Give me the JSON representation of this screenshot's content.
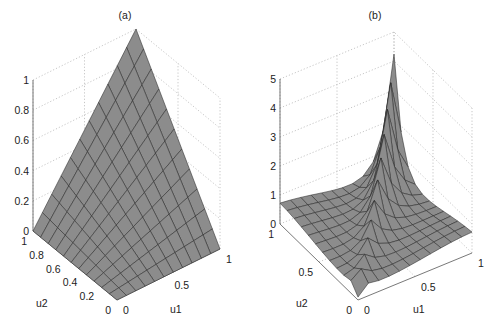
{
  "figure": {
    "background": "#ffffff",
    "surface_color": "#8c8c8c",
    "edge_color": "#2a2a2a",
    "grid_color": "#b8b8b8"
  },
  "chart_data": [
    {
      "type": "surface",
      "title": "(a)",
      "xlabel": "u1",
      "ylabel": "u2",
      "zlabel": "",
      "xlim": [
        0,
        1
      ],
      "ylim": [
        0,
        1
      ],
      "zlim": [
        0,
        1
      ],
      "xticks": [
        "0",
        "0.5",
        "1"
      ],
      "yticks": [
        "0",
        "0.2",
        "0.4",
        "0.6",
        "0.8",
        "1"
      ],
      "zticks": [
        "0",
        "0.2",
        "0.4",
        "0.6",
        "0.8",
        "1"
      ],
      "grid": true,
      "mesh": 11,
      "description": "z = u1*u2 (bilinear surface rising from 0 along edges u1=0 and u2=0 to 1 at corner (1,1))",
      "surface_formula": "u1*u2"
    },
    {
      "type": "surface",
      "title": "(b)",
      "xlabel": "u1",
      "ylabel": "u2",
      "zlabel": "",
      "xlim": [
        0,
        1
      ],
      "ylim": [
        0,
        1
      ],
      "zlim": [
        0,
        5
      ],
      "xticks": [
        "0",
        "0.5",
        "1"
      ],
      "yticks": [
        "0",
        "0.5",
        "1"
      ],
      "zticks": [
        "0",
        "1",
        "2",
        "3",
        "4",
        "5"
      ],
      "grid": true,
      "mesh": 11,
      "description": "Density-like surface with sharp ridge along diagonal u1=u2, peaking near 4.2 at corner (1,1), low near (0,0) and along off-diagonal edges",
      "surface_formula": "ridge"
    }
  ]
}
